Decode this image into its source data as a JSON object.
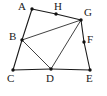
{
  "figure": {
    "type": "line-diagram",
    "width": 107,
    "height": 96,
    "background_color": "#ffffff",
    "stroke_color": "#1a1a1a",
    "label_color": "#1a1a1a"
  },
  "vertices": [
    {
      "id": "A",
      "label": "A",
      "x": 32,
      "y": 9,
      "label_x": 18,
      "label_y": 1,
      "dot_r": 1.7
    },
    {
      "id": "H",
      "label": "H",
      "x": 56,
      "y": 14,
      "label_x": 54,
      "label_y": 1,
      "dot_r": 1.7
    },
    {
      "id": "G",
      "label": "G",
      "x": 81,
      "y": 20,
      "label_x": 84,
      "label_y": 7,
      "dot_r": 1.7
    },
    {
      "id": "B",
      "label": "B",
      "x": 22,
      "y": 40,
      "label_x": 9,
      "label_y": 31,
      "dot_r": 1.7
    },
    {
      "id": "F",
      "label": "F",
      "x": 84,
      "y": 42,
      "label_x": 87,
      "label_y": 34,
      "dot_r": 1.7
    },
    {
      "id": "C",
      "label": "C",
      "x": 13,
      "y": 70,
      "label_x": 7,
      "label_y": 73,
      "dot_r": 1.7
    },
    {
      "id": "D",
      "label": "D",
      "x": 51,
      "y": 69,
      "label_x": 46,
      "label_y": 73,
      "dot_r": 1.7
    },
    {
      "id": "E",
      "label": "E",
      "x": 90,
      "y": 70,
      "label_x": 86,
      "label_y": 73,
      "dot_r": 1.7
    }
  ],
  "edges": [
    {
      "id": "edge-A-H",
      "from": "A",
      "to": "H",
      "path": "M 32 9 L 56 14"
    },
    {
      "id": "edge-H-G",
      "from": "H",
      "to": "G",
      "path": "M 56 14 L 81 20"
    },
    {
      "id": "edge-A-B",
      "from": "A",
      "to": "B",
      "path": "M 32 9 L 22 40"
    },
    {
      "id": "edge-B-C",
      "from": "B",
      "to": "C",
      "path": "M 22 40 L 13 70"
    },
    {
      "id": "edge-C-D",
      "from": "C",
      "to": "D",
      "path": "M 13 70 L 51 69"
    },
    {
      "id": "edge-D-E",
      "from": "D",
      "to": "E",
      "path": "M 51 69 L 90 70"
    },
    {
      "id": "edge-G-F",
      "from": "G",
      "to": "F",
      "path": "M 81 20 L 84 42"
    },
    {
      "id": "edge-F-E",
      "from": "F",
      "to": "E",
      "path": "M 84 42 L 90 70"
    },
    {
      "id": "edge-B-G",
      "from": "B",
      "to": "G",
      "path": "M 22 40 L 81 20"
    },
    {
      "id": "edge-B-D",
      "from": "B",
      "to": "D",
      "path": "M 22 40 L 51 69"
    },
    {
      "id": "edge-D-G",
      "from": "D",
      "to": "G",
      "path": "M 51 69 L 81 20"
    }
  ]
}
